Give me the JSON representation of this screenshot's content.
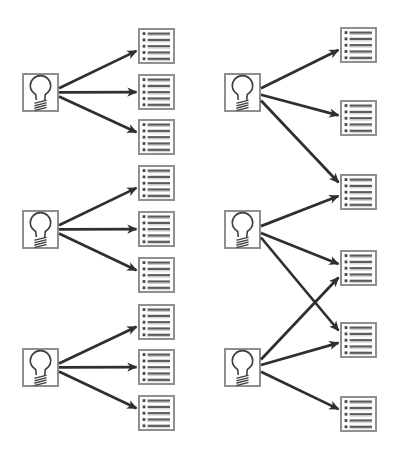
{
  "canvas": {
    "width": 405,
    "height": 458,
    "background": "#ffffff"
  },
  "style": {
    "box_border": "#8f8f8f",
    "bulb_box_fill": "#ffffff",
    "doc_box_fill": "#fdfdfd",
    "doc_line": "#5c5c5c",
    "doc_line_shadow": "#c6c6c6",
    "doc_bullet": "#484848",
    "bulb_stroke": "#3f3f3f",
    "arrow": "#2f2f2f"
  },
  "node_size": {
    "bulb_w": 37,
    "bulb_h": 39,
    "doc_w": 37,
    "doc_h": 36,
    "doc_rows": 5
  },
  "panels": [
    {
      "name": "left-panel",
      "bulbs": [
        {
          "id": "left-bulb-1",
          "icon": "lightbulb-icon",
          "x": 22,
          "y": 73
        },
        {
          "id": "left-bulb-2",
          "icon": "lightbulb-icon",
          "x": 22,
          "y": 210
        },
        {
          "id": "left-bulb-3",
          "icon": "lightbulb-icon",
          "x": 22,
          "y": 348
        }
      ],
      "docs": [
        {
          "id": "left-doc-1",
          "icon": "bulleted-list-icon",
          "x": 138,
          "y": 28
        },
        {
          "id": "left-doc-2",
          "icon": "bulleted-list-icon",
          "x": 138,
          "y": 74
        },
        {
          "id": "left-doc-3",
          "icon": "bulleted-list-icon",
          "x": 138,
          "y": 119
        },
        {
          "id": "left-doc-4",
          "icon": "bulleted-list-icon",
          "x": 138,
          "y": 165
        },
        {
          "id": "left-doc-5",
          "icon": "bulleted-list-icon",
          "x": 138,
          "y": 211
        },
        {
          "id": "left-doc-6",
          "icon": "bulleted-list-icon",
          "x": 138,
          "y": 257
        },
        {
          "id": "left-doc-7",
          "icon": "bulleted-list-icon",
          "x": 138,
          "y": 304
        },
        {
          "id": "left-doc-8",
          "icon": "bulleted-list-icon",
          "x": 138,
          "y": 349
        },
        {
          "id": "left-doc-9",
          "icon": "bulleted-list-icon",
          "x": 138,
          "y": 395
        }
      ],
      "edges": [
        [
          "left-bulb-1",
          "left-doc-1"
        ],
        [
          "left-bulb-1",
          "left-doc-2"
        ],
        [
          "left-bulb-1",
          "left-doc-3"
        ],
        [
          "left-bulb-2",
          "left-doc-4"
        ],
        [
          "left-bulb-2",
          "left-doc-5"
        ],
        [
          "left-bulb-2",
          "left-doc-6"
        ],
        [
          "left-bulb-3",
          "left-doc-7"
        ],
        [
          "left-bulb-3",
          "left-doc-8"
        ],
        [
          "left-bulb-3",
          "left-doc-9"
        ]
      ]
    },
    {
      "name": "right-panel",
      "bulbs": [
        {
          "id": "right-bulb-1",
          "icon": "lightbulb-icon",
          "x": 224,
          "y": 73
        },
        {
          "id": "right-bulb-2",
          "icon": "lightbulb-icon",
          "x": 224,
          "y": 210
        },
        {
          "id": "right-bulb-3",
          "icon": "lightbulb-icon",
          "x": 224,
          "y": 348
        }
      ],
      "docs": [
        {
          "id": "right-doc-1",
          "icon": "bulleted-list-icon",
          "x": 340,
          "y": 27
        },
        {
          "id": "right-doc-2",
          "icon": "bulleted-list-icon",
          "x": 340,
          "y": 100
        },
        {
          "id": "right-doc-3",
          "icon": "bulleted-list-icon",
          "x": 340,
          "y": 174
        },
        {
          "id": "right-doc-4",
          "icon": "bulleted-list-icon",
          "x": 340,
          "y": 250
        },
        {
          "id": "right-doc-5",
          "icon": "bulleted-list-icon",
          "x": 340,
          "y": 322
        },
        {
          "id": "right-doc-6",
          "icon": "bulleted-list-icon",
          "x": 340,
          "y": 396
        }
      ],
      "edges": [
        [
          "right-bulb-1",
          "right-doc-1"
        ],
        [
          "right-bulb-1",
          "right-doc-2"
        ],
        [
          "right-bulb-1",
          "right-doc-3"
        ],
        [
          "right-bulb-2",
          "right-doc-3"
        ],
        [
          "right-bulb-2",
          "right-doc-4"
        ],
        [
          "right-bulb-2",
          "right-doc-5"
        ],
        [
          "right-bulb-3",
          "right-doc-4"
        ],
        [
          "right-bulb-3",
          "right-doc-5"
        ],
        [
          "right-bulb-3",
          "right-doc-6"
        ]
      ]
    }
  ]
}
